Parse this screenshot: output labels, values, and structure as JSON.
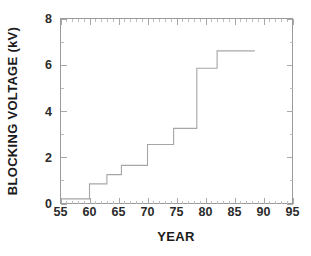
{
  "chart_data": {
    "type": "line",
    "subtype": "step-post",
    "title": "",
    "xlabel": "YEAR",
    "ylabel": "BLOCKING VOLTAGE  (kV)",
    "xlim": [
      55,
      95
    ],
    "ylim": [
      0,
      8
    ],
    "xticks": [
      55,
      60,
      65,
      70,
      75,
      80,
      85,
      90,
      95
    ],
    "xtick_labels": [
      "55",
      "60",
      "65",
      "70",
      "75",
      "80",
      "85",
      "90",
      "95"
    ],
    "yticks": [
      0,
      2,
      4,
      6,
      8
    ],
    "ytick_labels": [
      "0",
      "2",
      "4",
      "6",
      "8"
    ],
    "x_minor_tick_step": 1,
    "y_minor_tick_step": 1,
    "grid": false,
    "legend": null,
    "line_color": "#a6a6a6",
    "background_color": "#ffffff",
    "axis_color": "#9a9a9a",
    "x": [
      55,
      60,
      63,
      65.5,
      70,
      74.5,
      78.5,
      82,
      88.5
    ],
    "values": [
      0.2,
      0.85,
      1.25,
      1.65,
      2.55,
      3.25,
      5.85,
      6.6,
      6.6
    ],
    "steps": [
      {
        "year_start": 55,
        "year_end": 60,
        "voltage": 0.2
      },
      {
        "year_start": 60,
        "year_end": 63,
        "voltage": 0.85
      },
      {
        "year_start": 63,
        "year_end": 65.5,
        "voltage": 1.25
      },
      {
        "year_start": 65.5,
        "year_end": 70,
        "voltage": 1.65
      },
      {
        "year_start": 70,
        "year_end": 74.5,
        "voltage": 2.55
      },
      {
        "year_start": 74.5,
        "year_end": 78.5,
        "voltage": 3.25
      },
      {
        "year_start": 78.5,
        "year_end": 82,
        "voltage": 5.85
      },
      {
        "year_start": 82,
        "year_end": 88.5,
        "voltage": 6.6
      }
    ]
  }
}
